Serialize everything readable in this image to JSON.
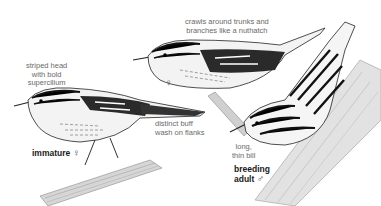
{
  "illustration": {
    "subject": "warbler field-guide plate",
    "colors": {
      "ink": "#111111",
      "shade": "#555555",
      "light_gray": "#bdbdbd",
      "annotation_text": "#6a6a6a",
      "label_text": "#1a1a1a",
      "background": "#ffffff"
    }
  },
  "annotations": {
    "striped_head": [
      "striped head",
      "with bold",
      "supercilium"
    ],
    "crawls": [
      "crawls around trunks and",
      "branches like a nuthatch"
    ],
    "buff_wash": [
      "distinct buff",
      "wash on flanks"
    ],
    "bill": [
      "long,",
      "thin bill"
    ]
  },
  "figures": {
    "immature": {
      "label": "immature",
      "sex_symbol": "♀"
    },
    "female": {
      "sex_symbol": "♀"
    },
    "breeding_adult": {
      "label_line1": "breeding",
      "label_line2": "adult",
      "sex_symbol": "♂"
    }
  }
}
